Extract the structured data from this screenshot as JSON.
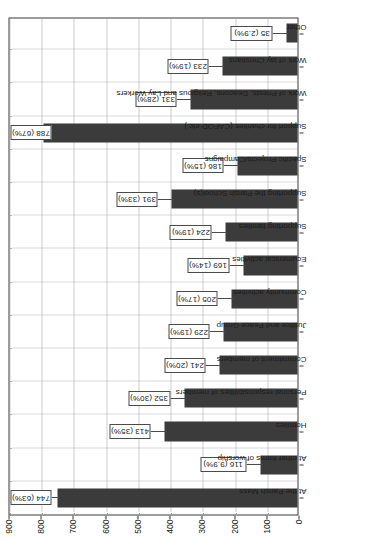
{
  "chart_data": {
    "type": "bar",
    "title": "",
    "subtitle": "",
    "xlabel": "",
    "ylabel": "",
    "orientation": "vertical-rotated-90ccw",
    "ylim": [
      0,
      900
    ],
    "ytick_step": 100,
    "grid": true,
    "legend": null,
    "bar_color": "#3b3b3b",
    "label_box_border": "#4a4a4a",
    "axis_color": "#3a3a3a",
    "gridline_color": "#9a9a9a",
    "yticks": [
      "0",
      "100",
      "200",
      "300",
      "400",
      "500",
      "600",
      "700",
      "800",
      "900"
    ],
    "ytick_values": [
      0,
      100,
      200,
      300,
      400,
      500,
      600,
      700,
      800,
      900
    ],
    "categories": [
      "At the Parish Mass",
      "At other forms of worship",
      "Homilies",
      "Personal responsibilities of members",
      "Commitment of members",
      "Justice and Peace Group",
      "Community activities",
      "Ecumenical activities",
      "Supporting families",
      "Supporting the Parish School(s)",
      "Specific Projects/Campaigns",
      "Support for charities (CAFOD etc.)",
      "Work of Priests, Deacons, Religious and Lay Workers",
      "Work of lay Christians",
      "Other"
    ],
    "values": [
      744,
      116,
      413,
      352,
      241,
      229,
      205,
      169,
      224,
      391,
      186,
      788,
      331,
      233,
      35
    ],
    "percentages": [
      "63%",
      "9.9%",
      "35%",
      "30%",
      "20%",
      "19%",
      "17%",
      "14%",
      "19%",
      "33%",
      "15%",
      "67%",
      "28%",
      "19%",
      "2.9%"
    ],
    "point_labels": [
      "744 (63%)",
      "116 (9.9%)",
      "413 (35%)",
      "352 (30%)",
      "241 (20%)",
      "229 (19%)",
      "205 (17%)",
      "169 (14%)",
      "224 (19%)",
      "391 (33%)",
      "186 (15%)",
      "788 (67%)",
      "331 (28%)",
      "233 (19%)",
      "35 (2.9%)"
    ]
  }
}
